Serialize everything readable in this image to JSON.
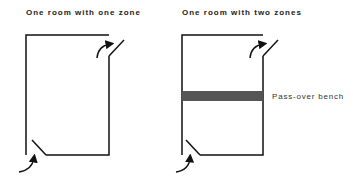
{
  "diagrams": [
    {
      "title": "One room with one zone"
    },
    {
      "title": "One room with two zones",
      "bench_label": "Pass-over bench"
    }
  ],
  "colors": {
    "wall": "#111111",
    "bench": "#555555"
  }
}
